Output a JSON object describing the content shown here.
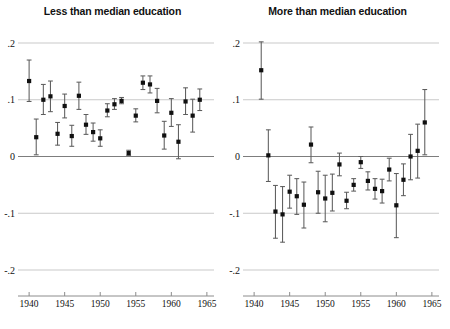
{
  "figure": {
    "width": 450,
    "height": 329,
    "background": "#ffffff",
    "point_color": "#101010",
    "ci_color": "#5d5d5d",
    "grid_color": "#c9c9c9",
    "axis_color": "#8c8c8c"
  },
  "panels": [
    {
      "id": "left",
      "title": "Less than median education"
    },
    {
      "id": "right",
      "title": "More than median education"
    }
  ],
  "chart_data": [
    {
      "type": "scatter",
      "title": "Less than median education",
      "xlabel": "",
      "ylabel": "",
      "xlim": [
        1939,
        1966
      ],
      "ylim": [
        -0.2,
        0.2
      ],
      "xticks": [
        1940,
        1945,
        1950,
        1955,
        1960,
        1965
      ],
      "xticklabels": [
        "1940",
        "1945",
        "1950",
        "1955",
        "1960",
        "1965"
      ],
      "yticks": [
        -0.2,
        -0.1,
        0,
        0.1,
        0.2
      ],
      "yticklabels": [
        "-.2",
        "-.1",
        "0",
        ".1",
        ".2"
      ],
      "grid": true,
      "gridlines_y": [
        0.2,
        0.1,
        -0.1,
        -0.2
      ],
      "zero_line_y": 0,
      "error_bars": "vertical-capped",
      "x": [
        1940,
        1941,
        1942,
        1943,
        1944,
        1945,
        1946,
        1947,
        1948,
        1949,
        1950,
        1951,
        1952,
        1953,
        1954,
        1955,
        1956,
        1957,
        1958,
        1959,
        1960,
        1961,
        1962,
        1963,
        1964
      ],
      "y": [
        0.133,
        0.034,
        0.1,
        0.106,
        0.04,
        0.089,
        0.036,
        0.107,
        0.056,
        0.043,
        0.032,
        0.081,
        0.092,
        0.098,
        0.006,
        0.072,
        0.13,
        0.127,
        0.098,
        0.037,
        0.077,
        0.026,
        0.097,
        0.072,
        0.1
      ],
      "y_low": [
        0.097,
        0.003,
        0.074,
        0.079,
        0.02,
        0.068,
        0.018,
        0.083,
        0.039,
        0.027,
        0.018,
        0.07,
        0.083,
        0.093,
        0.002,
        0.061,
        0.118,
        0.112,
        0.077,
        0.013,
        0.053,
        -0.004,
        0.074,
        0.043,
        0.081
      ],
      "y_high": [
        0.17,
        0.066,
        0.127,
        0.133,
        0.06,
        0.11,
        0.055,
        0.131,
        0.074,
        0.059,
        0.047,
        0.093,
        0.102,
        0.104,
        0.011,
        0.084,
        0.142,
        0.142,
        0.12,
        0.062,
        0.102,
        0.056,
        0.121,
        0.101,
        0.119
      ]
    },
    {
      "type": "scatter",
      "title": "More than median education",
      "xlabel": "",
      "ylabel": "",
      "xlim": [
        1939,
        1966
      ],
      "ylim": [
        -0.2,
        0.2
      ],
      "xticks": [
        1940,
        1945,
        1950,
        1955,
        1960,
        1965
      ],
      "xticklabels": [
        "1940",
        "1945",
        "1950",
        "1955",
        "1960",
        "1965"
      ],
      "yticks": [
        -0.2,
        -0.1,
        0,
        0.1,
        0.2
      ],
      "yticklabels": [
        "-.2",
        "-.1",
        "0",
        ".1",
        ".2"
      ],
      "grid": true,
      "gridlines_y": [
        0.2,
        0.1,
        -0.1,
        -0.2
      ],
      "zero_line_y": 0,
      "error_bars": "vertical-capped",
      "x": [
        1941,
        1942,
        1943,
        1944,
        1945,
        1946,
        1947,
        1948,
        1949,
        1950,
        1951,
        1952,
        1953,
        1954,
        1955,
        1956,
        1957,
        1958,
        1959,
        1960,
        1961,
        1962,
        1963,
        1964
      ],
      "y": [
        0.152,
        0.002,
        -0.097,
        -0.102,
        -0.062,
        -0.07,
        -0.085,
        0.021,
        -0.063,
        -0.074,
        -0.064,
        -0.014,
        -0.078,
        -0.05,
        -0.01,
        -0.043,
        -0.057,
        -0.061,
        -0.023,
        -0.086,
        -0.041,
        0.0,
        0.01,
        0.06
      ],
      "y_low": [
        0.101,
        -0.044,
        -0.144,
        -0.151,
        -0.091,
        -0.102,
        -0.126,
        -0.011,
        -0.1,
        -0.115,
        -0.096,
        -0.034,
        -0.092,
        -0.061,
        -0.021,
        -0.059,
        -0.075,
        -0.082,
        -0.043,
        -0.143,
        -0.069,
        -0.041,
        -0.038,
        0.003
      ],
      "y_high": [
        0.202,
        0.047,
        -0.051,
        -0.053,
        -0.033,
        -0.039,
        -0.045,
        0.052,
        -0.026,
        -0.033,
        -0.031,
        0.006,
        -0.063,
        -0.039,
        0.0,
        -0.027,
        -0.039,
        -0.04,
        -0.003,
        -0.03,
        -0.013,
        0.039,
        0.057,
        0.118
      ]
    }
  ]
}
